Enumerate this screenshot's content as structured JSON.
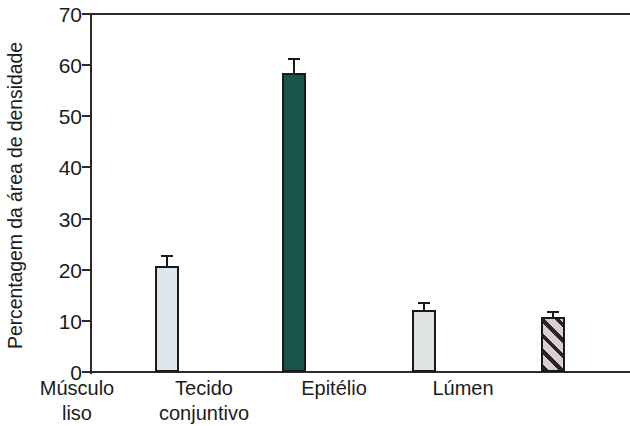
{
  "chart_data": {
    "type": "bar",
    "title": "",
    "xlabel": "",
    "ylabel": "Percentagem da área de densidade",
    "ylim": [
      0,
      70
    ],
    "ytick_labels": [
      "70",
      "60",
      "50",
      "40",
      "30",
      "20",
      "10",
      "0"
    ],
    "yticks": [
      70,
      60,
      50,
      40,
      30,
      20,
      10,
      0
    ],
    "grid": false,
    "legend": "none",
    "categories": [
      "Músculo liso",
      "Tecido conjuntivo",
      "Epitélio",
      "Lúmen"
    ],
    "category_lines": [
      [
        "Músculo",
        "liso"
      ],
      [
        "Tecido",
        "conjuntivo"
      ],
      [
        "Epitélio",
        ""
      ],
      [
        "Lúmen",
        ""
      ]
    ],
    "values": [
      20.8,
      58.5,
      12.2,
      10.7
    ],
    "errors": [
      1.7,
      2.5,
      1.1,
      0.8
    ],
    "bar_colors": [
      "#dde7ef",
      "#17544a",
      "#dfe4e0",
      "#d9cdd2"
    ],
    "bar_patterns": [
      "solid",
      "solid",
      "solid",
      "diagonal-hatch"
    ],
    "bar_edge_color": "#1a1a1a",
    "axis_color": "#2b2b2b"
  },
  "axis": {
    "y_title": "Percentagem da área de densidade"
  }
}
